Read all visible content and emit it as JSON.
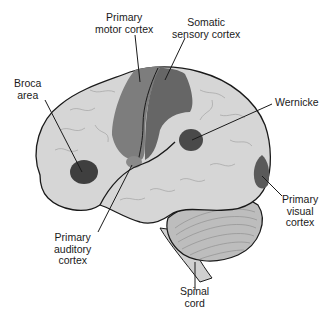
{
  "diagram": {
    "type": "labeled anatomical illustration",
    "labels": {
      "primary_motor_cortex": {
        "line1": "Primary",
        "line2": "motor cortex"
      },
      "somatic_sensory_cortex": {
        "line1": "Somatic",
        "line2": "sensory cortex"
      },
      "broca_area": {
        "line1": "Broca",
        "line2": "area"
      },
      "wernicke": {
        "line1": "Wernicke"
      },
      "primary_visual_cortex": {
        "line1": "Primary",
        "line2": "visual",
        "line3": "cortex"
      },
      "primary_auditory_cortex": {
        "line1": "Primary",
        "line2": "auditory",
        "line3": "cortex"
      },
      "spinal_cord": {
        "line1": "Spinal",
        "line2": "cord"
      }
    },
    "colors": {
      "brain_fill": "#d6d6d6",
      "motor_region": "#7d7d7d",
      "sensory_region": "#666666",
      "dark_areas": "#4a4a4a",
      "cerebellum": "#bdbdbd",
      "outline": "#1a1a1a"
    }
  }
}
